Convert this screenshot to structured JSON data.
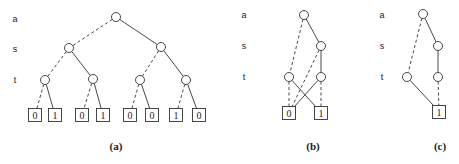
{
  "diagrams": [
    {
      "id": "a",
      "caption": "(a)",
      "caption_pos": [
        116,
        146
      ],
      "var_label_x": 15,
      "var_labels": [
        {
          "text": "a",
          "y": 19
        },
        {
          "text": "s",
          "y": 49
        },
        {
          "text": "t",
          "y": 80
        }
      ],
      "nodes": [
        {
          "id": "a0",
          "x": 116,
          "y": 17
        },
        {
          "id": "s0",
          "x": 69,
          "y": 48
        },
        {
          "id": "s1",
          "x": 161,
          "y": 47
        },
        {
          "id": "t0",
          "x": 45,
          "y": 80
        },
        {
          "id": "t1",
          "x": 93,
          "y": 79
        },
        {
          "id": "t2",
          "x": 140,
          "y": 80
        },
        {
          "id": "t3",
          "x": 186,
          "y": 80
        }
      ],
      "leaves": [
        {
          "id": "l0",
          "x": 35,
          "y": 115,
          "value": "0"
        },
        {
          "id": "l1",
          "x": 55,
          "y": 115,
          "value": "1"
        },
        {
          "id": "l2",
          "x": 82,
          "y": 115,
          "value": "0"
        },
        {
          "id": "l3",
          "x": 103,
          "y": 115,
          "value": "1"
        },
        {
          "id": "l4",
          "x": 130,
          "y": 115,
          "value": "0"
        },
        {
          "id": "l5",
          "x": 152,
          "y": 115,
          "value": "0"
        },
        {
          "id": "l6",
          "x": 176,
          "y": 115,
          "value": "1"
        },
        {
          "id": "l7",
          "x": 199,
          "y": 115,
          "value": "0"
        }
      ],
      "edges": [
        {
          "from": "a0",
          "to": "s0",
          "dashed": true
        },
        {
          "from": "a0",
          "to": "s1",
          "dashed": false
        },
        {
          "from": "s0",
          "to": "t0",
          "dashed": true
        },
        {
          "from": "s0",
          "to": "t1",
          "dashed": false
        },
        {
          "from": "s1",
          "to": "t2",
          "dashed": true
        },
        {
          "from": "s1",
          "to": "t3",
          "dashed": false
        },
        {
          "from": "t0",
          "to": "l0",
          "dashed": true
        },
        {
          "from": "t0",
          "to": "l1",
          "dashed": false
        },
        {
          "from": "t1",
          "to": "l2",
          "dashed": true
        },
        {
          "from": "t1",
          "to": "l3",
          "dashed": false
        },
        {
          "from": "t2",
          "to": "l4",
          "dashed": true
        },
        {
          "from": "t2",
          "to": "l5",
          "dashed": false
        },
        {
          "from": "t3",
          "to": "l6",
          "dashed": true
        },
        {
          "from": "t3",
          "to": "l7",
          "dashed": false
        }
      ]
    },
    {
      "id": "b",
      "caption": "(b)",
      "caption_pos": [
        313,
        146
      ],
      "var_label_x": 244,
      "var_labels": [
        {
          "text": "a",
          "y": 15
        },
        {
          "text": "s",
          "y": 46
        },
        {
          "text": "t",
          "y": 77
        }
      ],
      "nodes": [
        {
          "id": "a0",
          "x": 304,
          "y": 15
        },
        {
          "id": "s0",
          "x": 321,
          "y": 46
        },
        {
          "id": "t0",
          "x": 289,
          "y": 77
        },
        {
          "id": "t1",
          "x": 321,
          "y": 77
        }
      ],
      "leaves": [
        {
          "id": "l0",
          "x": 289,
          "y": 113,
          "value": "0"
        },
        {
          "id": "l1",
          "x": 321,
          "y": 113,
          "value": "1"
        }
      ],
      "edges": [
        {
          "from": "a0",
          "to": "t0",
          "dashed": true
        },
        {
          "from": "a0",
          "to": "s0",
          "dashed": false
        },
        {
          "from": "s0",
          "to": "l0",
          "dashed": true
        },
        {
          "from": "s0",
          "to": "t1",
          "dashed": false
        },
        {
          "from": "t0",
          "to": "l0",
          "dashed": true
        },
        {
          "from": "t0",
          "to": "l1",
          "dashed": false
        },
        {
          "from": "t1",
          "to": "l0",
          "dashed": false
        },
        {
          "from": "t1",
          "to": "l1",
          "dashed": true
        }
      ]
    },
    {
      "id": "c",
      "caption": "(c)",
      "caption_pos": [
        440,
        146
      ],
      "var_label_x": 382,
      "var_labels": [
        {
          "text": "a",
          "y": 15
        },
        {
          "text": "s",
          "y": 46
        },
        {
          "text": "t",
          "y": 77
        }
      ],
      "nodes": [
        {
          "id": "a0",
          "x": 423,
          "y": 14
        },
        {
          "id": "s0",
          "x": 438,
          "y": 46
        },
        {
          "id": "t0",
          "x": 407,
          "y": 77
        },
        {
          "id": "t1",
          "x": 438,
          "y": 77
        }
      ],
      "leaves": [
        {
          "id": "l0",
          "x": 439,
          "y": 112,
          "value": "1"
        }
      ],
      "edges": [
        {
          "from": "a0",
          "to": "t0",
          "dashed": true
        },
        {
          "from": "a0",
          "to": "s0",
          "dashed": false
        },
        {
          "from": "s0",
          "to": "t1",
          "dashed": false
        },
        {
          "from": "t0",
          "to": "l0",
          "dashed": false
        },
        {
          "from": "t1",
          "to": "l0",
          "dashed": true
        }
      ]
    }
  ],
  "style": {
    "node_radius": 4.5,
    "leaf_size": 13,
    "stroke_color": "#333333"
  }
}
